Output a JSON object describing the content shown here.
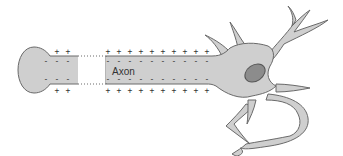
{
  "diagram": {
    "type": "neuron-membrane-charge",
    "labels": {
      "axon": "Axon"
    },
    "charges": {
      "outside_symbol": "+",
      "inside_symbol": "-",
      "left_segment_count": 2,
      "right_segment_count": 10
    },
    "colors": {
      "cell_fill": "#cfcfcf",
      "cell_stroke": "#6a6a6a",
      "nucleus_fill": "#8c8c8c",
      "nucleus_stroke": "#555555",
      "charge_color": "#333333",
      "background": "#ffffff"
    }
  }
}
